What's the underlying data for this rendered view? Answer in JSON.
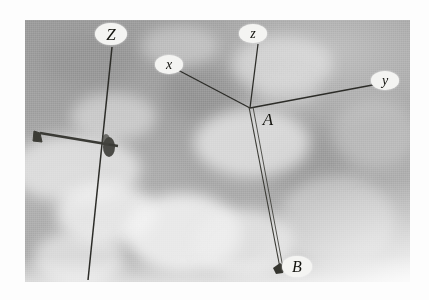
{
  "figure": {
    "kind": "photograph-with-annotations",
    "background_color": "#a5a5a5",
    "label_fill": "#f4f4f2",
    "line_color": "#2b2b28"
  },
  "labels": [
    {
      "id": "Z",
      "text": "Z",
      "style": "ellipse",
      "x": 111,
      "y": 34,
      "note": "upper-left mast axis"
    },
    {
      "id": "z",
      "text": "z",
      "style": "ellipse",
      "x": 253,
      "y": 33,
      "note": "local vertical axis"
    },
    {
      "id": "x",
      "text": "x",
      "style": "ellipse",
      "x": 169,
      "y": 64,
      "note": "local x axis"
    },
    {
      "id": "y",
      "text": "y",
      "style": "ellipse",
      "x": 385,
      "y": 80,
      "note": "local y axis"
    },
    {
      "id": "A",
      "text": "A",
      "style": "plain",
      "x": 268,
      "y": 119,
      "note": "origin / vertex point"
    },
    {
      "id": "B",
      "text": "B",
      "style": "ellipse",
      "x": 297,
      "y": 266,
      "note": "lower end point"
    }
  ],
  "segments": [
    {
      "from": "A",
      "to": "x",
      "x1": 250,
      "y1": 108,
      "x2": 176,
      "y2": 69
    },
    {
      "from": "A",
      "to": "y",
      "x1": 250,
      "y1": 108,
      "x2": 378,
      "y2": 84
    },
    {
      "from": "A",
      "to": "z",
      "x1": 250,
      "y1": 108,
      "x2": 258,
      "y2": 44
    },
    {
      "from": "A",
      "to": "B",
      "x1": 251,
      "y1": 110,
      "x2": 281,
      "y2": 268
    },
    {
      "from": "Z-top",
      "to": "Z-bottom",
      "x1": 112,
      "y1": 47,
      "x2": 88,
      "y2": 280
    }
  ],
  "markers": [
    {
      "name": "point-B-marker",
      "x": 280,
      "y": 270
    },
    {
      "name": "mast-crossarm-node",
      "x": 110,
      "y": 148
    },
    {
      "name": "crossarm-end",
      "x": 40,
      "y": 134
    }
  ],
  "frame": {
    "left": 25,
    "top": 20,
    "width": 385,
    "height": 262
  }
}
